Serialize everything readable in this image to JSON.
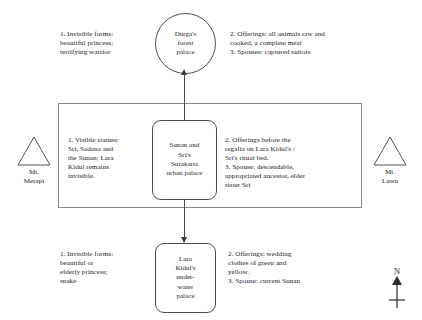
{
  "diagram": {
    "nodes": {
      "top": {
        "id": "durga-forest-palace",
        "label": "Durga's\nforest\npalace",
        "shape": "circle"
      },
      "middle": {
        "id": "surakarta-urban-palace",
        "label": "Sunan and\nSri's\nSurakarta\nurban palace",
        "shape": "rounded-rect"
      },
      "bottom": {
        "id": "lara-kidul-underwater-palace",
        "label": "Lara\nKidul's\nunder-\nwater\npalace",
        "shape": "rounded-rect"
      }
    },
    "annotations": {
      "durga_left": "1. Invisible forms:\nbeautiful princess;\nterrifying warrior",
      "durga_right": "2. Offerings: all animals raw and\ncooked, a complete meal\n3. Spouses: captured suitors",
      "middle_left": "1. Visible statues:\nSri, Sadana and\nthe Sunan; Lara\nKidul remains\ninvisible.",
      "middle_right": "2. Offerings before the\nregalia on Lara Kidul's /\nSri's ritual bed.\n3. Spouse: descendable,\nappropriated ancestor, elder\nsister Sri",
      "bottom_left": "1. Invisible forms:\nbeautiful or\nelderly princess;\nsnake",
      "bottom_right": "2. Offerings: wedding\nclothes of green and\nyellow.\n3. Spouse: current Sunan"
    },
    "mountains": {
      "left": "Mt.\nMerapi",
      "right": "Mt.\nLawu"
    },
    "compass": {
      "letter": "N",
      "direction": "north"
    },
    "colors": {
      "background": "#ffffff",
      "text": "#232323",
      "node_stroke": "#4d4d4d",
      "rect_stroke": "#8a8a8a",
      "connector": "#4a4a4a"
    }
  }
}
